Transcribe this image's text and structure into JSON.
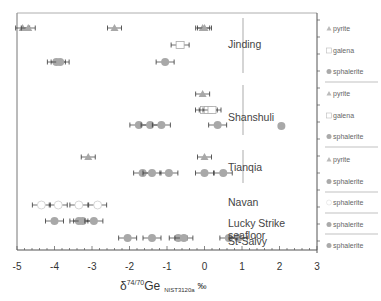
{
  "chart_data": {
    "type": "scatter",
    "title": "",
    "xlabel": "δ74/70Ge NIST3120a ‰",
    "xlabel_parts": {
      "delta": "δ",
      "sup": "74/70",
      "main": "Ge",
      "sub": "NIST3120a",
      "unit": "‰"
    },
    "ylabel": "",
    "xlim": [
      -5,
      3
    ],
    "x_ticks": [
      "-5",
      "-4",
      "-3",
      "-2",
      "-1",
      "0",
      "1",
      "2",
      "3"
    ],
    "grid": false,
    "legend_position": "right",
    "groups": [
      {
        "location": "Jinding",
        "series": [
          {
            "mineral": "pyrite",
            "marker": "triangle",
            "values": [
              -4.85,
              -4.7,
              -2.4,
              -0.05,
              0.0
            ]
          },
          {
            "mineral": "galena",
            "marker": "open-square",
            "values": [
              -0.65
            ]
          },
          {
            "mineral": "sphalerite",
            "marker": "circle",
            "values": [
              -3.95,
              -3.85,
              -1.05
            ]
          }
        ]
      },
      {
        "location": "Shanshuli",
        "series": [
          {
            "mineral": "pyrite",
            "marker": "triangle",
            "values": [
              -0.05
            ]
          },
          {
            "mineral": "galena",
            "marker": "open-square",
            "values": [
              0.0,
              0.1,
              0.2
            ]
          },
          {
            "mineral": "sphalerite",
            "marker": "circle",
            "values": [
              -1.75,
              -1.45,
              -1.15,
              0.35
            ]
          }
        ]
      },
      {
        "location": "Tianqia",
        "series": [
          {
            "mineral": "pyrite",
            "marker": "triangle",
            "values": [
              -3.1,
              0.0
            ]
          },
          {
            "mineral": "sphalerite",
            "marker": "circle",
            "values": [
              -1.65,
              -1.4,
              -0.95,
              0.0,
              0.5
            ]
          }
        ]
      },
      {
        "location": "Navan",
        "series": [
          {
            "mineral": "sphalerite",
            "marker": "open-circle",
            "values": [
              -4.35,
              -3.9,
              -3.35,
              -2.85
            ]
          }
        ]
      },
      {
        "location": "Lucky Strike seafloor",
        "series": [
          {
            "mineral": "sphalerite",
            "marker": "circle",
            "values": [
              -4.0,
              -3.35,
              -3.25,
              -2.95
            ]
          }
        ]
      },
      {
        "location": "St-Salvy",
        "series": [
          {
            "mineral": "sphalerite",
            "marker": "circle",
            "values": [
              -2.05,
              -1.4,
              -0.7,
              -0.55,
              0.65,
              0.9
            ]
          }
        ]
      }
    ],
    "outlier_labels": {
      "Shanshuli_sphalerite_right_of_axis": 2.05
    }
  },
  "labels": {
    "jinding": "Jinding",
    "shanshuli": "Shanshuli",
    "tianqia": "Tianqia",
    "navan": "Navan",
    "lucky1": "Lucky Strike",
    "lucky2": "seafloor",
    "stsalvy": "St-Salvy"
  },
  "legend": [
    {
      "label": "pyrite",
      "marker": "triangle"
    },
    {
      "label": "galena",
      "marker": "open-square"
    },
    {
      "label": "sphalerite",
      "marker": "circle"
    },
    {
      "label": "pyrite",
      "marker": "triangle"
    },
    {
      "label": "galena",
      "marker": "open-square"
    },
    {
      "label": "sphalerite",
      "marker": "circle"
    },
    {
      "label": "pyrite",
      "marker": "triangle"
    },
    {
      "label": "sphalerite",
      "marker": "circle"
    },
    {
      "label": "sphalerite",
      "marker": "open-circle"
    },
    {
      "label": "sphalerite",
      "marker": "circle"
    },
    {
      "label": "sphalerite",
      "marker": "circle"
    }
  ],
  "colors": {
    "marker": "#a8a8a8",
    "axis": "#555555",
    "errorbar": "#333333"
  }
}
